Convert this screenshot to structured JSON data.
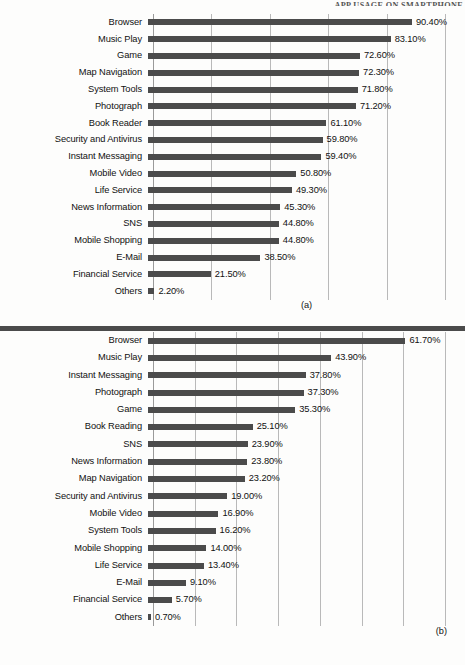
{
  "header": {
    "running_title": "APP USAGE ON SMARTPHONE"
  },
  "charts": [
    {
      "id": "chart-a",
      "caption": "(a)",
      "axis_max": 100,
      "gridlines": [
        0,
        20,
        40,
        60,
        80,
        100
      ],
      "rows": [
        {
          "label": "Browser",
          "value": 90.4,
          "value_label": "90.40%"
        },
        {
          "label": "Music Play",
          "value": 83.1,
          "value_label": "83.10%"
        },
        {
          "label": "Game",
          "value": 72.6,
          "value_label": "72.60%"
        },
        {
          "label": "Map Navigation",
          "value": 72.3,
          "value_label": "72.30%"
        },
        {
          "label": "System Tools",
          "value": 71.8,
          "value_label": "71.80%"
        },
        {
          "label": "Photograph",
          "value": 71.2,
          "value_label": "71.20%"
        },
        {
          "label": "Book Reader",
          "value": 61.1,
          "value_label": "61.10%"
        },
        {
          "label": "Security and Antivirus",
          "value": 59.8,
          "value_label": "59.80%"
        },
        {
          "label": "Instant Messaging",
          "value": 59.4,
          "value_label": "59.40%"
        },
        {
          "label": "Mobile Video",
          "value": 50.8,
          "value_label": "50.80%"
        },
        {
          "label": "Life Service",
          "value": 49.3,
          "value_label": "49.30%"
        },
        {
          "label": "News Information",
          "value": 45.3,
          "value_label": "45.30%"
        },
        {
          "label": "SNS",
          "value": 44.8,
          "value_label": "44.80%"
        },
        {
          "label": "Mobile Shopping",
          "value": 44.8,
          "value_label": "44.80%"
        },
        {
          "label": "E-Mail",
          "value": 38.5,
          "value_label": "38.50%"
        },
        {
          "label": "Financial Service",
          "value": 21.5,
          "value_label": "21.50%"
        },
        {
          "label": "Others",
          "value": 2.2,
          "value_label": "2.20%"
        }
      ]
    },
    {
      "id": "chart-b",
      "caption": "(b)",
      "axis_max": 70,
      "gridlines": [
        0,
        10,
        20,
        30,
        40,
        50,
        60,
        70
      ],
      "rows": [
        {
          "label": "Browser",
          "value": 61.7,
          "value_label": "61.70%"
        },
        {
          "label": "Music Play",
          "value": 43.9,
          "value_label": "43.90%"
        },
        {
          "label": "Instant Messaging",
          "value": 37.8,
          "value_label": "37.80%"
        },
        {
          "label": "Photograph",
          "value": 37.3,
          "value_label": "37.30%"
        },
        {
          "label": "Game",
          "value": 35.3,
          "value_label": "35.30%"
        },
        {
          "label": "Book Reading",
          "value": 25.1,
          "value_label": "25.10%"
        },
        {
          "label": "SNS",
          "value": 23.9,
          "value_label": "23.90%"
        },
        {
          "label": "News Information",
          "value": 23.8,
          "value_label": "23.80%"
        },
        {
          "label": "Map Navigation",
          "value": 23.2,
          "value_label": "23.20%"
        },
        {
          "label": "Security and Antivirus",
          "value": 19.0,
          "value_label": "19.00%"
        },
        {
          "label": "Mobile Video",
          "value": 16.9,
          "value_label": "16.90%"
        },
        {
          "label": "System Tools",
          "value": 16.2,
          "value_label": "16.20%"
        },
        {
          "label": "Mobile Shopping",
          "value": 14.0,
          "value_label": "14.00%"
        },
        {
          "label": "Life Service",
          "value": 13.4,
          "value_label": "13.40%"
        },
        {
          "label": "E-Mail",
          "value": 9.1,
          "value_label": "9.10%"
        },
        {
          "label": "Financial Service",
          "value": 5.7,
          "value_label": "5.70%"
        },
        {
          "label": "Others",
          "value": 0.7,
          "value_label": "0.70%"
        }
      ]
    }
  ],
  "chart_data": [
    {
      "type": "bar",
      "orientation": "horizontal",
      "title": "(a)",
      "xlabel": "",
      "ylabel": "",
      "xlim": [
        0,
        100
      ],
      "grid": true,
      "gridlines_x": [
        0,
        20,
        40,
        60,
        80,
        100
      ],
      "legend": "none",
      "units": "percent",
      "categories": [
        "Browser",
        "Music Play",
        "Game",
        "Map Navigation",
        "System Tools",
        "Photograph",
        "Book Reader",
        "Security and Antivirus",
        "Instant Messaging",
        "Mobile Video",
        "Life Service",
        "News Information",
        "SNS",
        "Mobile Shopping",
        "E-Mail",
        "Financial Service",
        "Others"
      ],
      "values": [
        90.4,
        83.1,
        72.6,
        72.3,
        71.8,
        71.2,
        61.1,
        59.8,
        59.4,
        50.8,
        49.3,
        45.3,
        44.8,
        44.8,
        38.5,
        21.5,
        2.2
      ],
      "data_labels": [
        "90.40%",
        "83.10%",
        "72.60%",
        "72.30%",
        "71.80%",
        "71.20%",
        "61.10%",
        "59.80%",
        "59.40%",
        "50.80%",
        "49.30%",
        "45.30%",
        "44.80%",
        "44.80%",
        "38.50%",
        "21.50%",
        "2.20%"
      ],
      "bar_color": "#4b4b4b"
    },
    {
      "type": "bar",
      "orientation": "horizontal",
      "title": "(b)",
      "xlabel": "",
      "ylabel": "",
      "xlim": [
        0,
        70
      ],
      "grid": true,
      "gridlines_x": [
        0,
        10,
        20,
        30,
        40,
        50,
        60,
        70
      ],
      "legend": "none",
      "units": "percent",
      "categories": [
        "Browser",
        "Music Play",
        "Instant Messaging",
        "Photograph",
        "Game",
        "Book Reading",
        "SNS",
        "News Information",
        "Map Navigation",
        "Security and Antivirus",
        "Mobile Video",
        "System Tools",
        "Mobile Shopping",
        "Life Service",
        "E-Mail",
        "Financial Service",
        "Others"
      ],
      "values": [
        61.7,
        43.9,
        37.8,
        37.3,
        35.3,
        25.1,
        23.9,
        23.8,
        23.2,
        19.0,
        16.9,
        16.2,
        14.0,
        13.4,
        9.1,
        5.7,
        0.7
      ],
      "data_labels": [
        "61.70%",
        "43.90%",
        "37.80%",
        "37.30%",
        "35.30%",
        "25.10%",
        "23.90%",
        "23.80%",
        "23.20%",
        "19.00%",
        "16.90%",
        "16.20%",
        "14.00%",
        "13.40%",
        "9.10%",
        "5.70%",
        "0.70%"
      ],
      "bar_color": "#4b4b4b"
    }
  ]
}
